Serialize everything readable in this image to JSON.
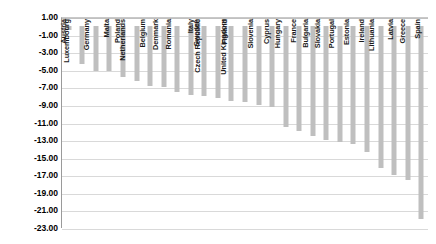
{
  "chart_data": {
    "type": "bar",
    "title": "",
    "subtitle": "",
    "xlabel": "",
    "ylabel": "",
    "ylim": [
      -23,
      1
    ],
    "grid": true,
    "legend": "none",
    "orientation": "vertical",
    "bar_color": "#bfbfbf",
    "ytick_labels": [
      "1.00",
      "-1.00",
      "-3.00",
      "-5.00",
      "-7.00",
      "-9.00",
      "-11.00",
      "-13.00",
      "-15.00",
      "-17.00",
      "-19.00",
      "-21.00",
      "-23.00"
    ],
    "ytick_values": [
      1,
      -1,
      -3,
      -5,
      -7,
      -9,
      -11,
      -13,
      -15,
      -17,
      -19,
      -21,
      -23
    ],
    "categories": [
      "Austria",
      "Luxembourg",
      "Germany",
      "Malta",
      "Poland",
      "Netherlands",
      "Belgium",
      "Denmark",
      "Romania",
      "Italy",
      "Sweden",
      "Czech Republic",
      "Finland",
      "United Kingdom",
      "Slovenia",
      "Cyprus",
      "Hungary",
      "France",
      "Bulgaria",
      "Slovakia",
      "Portugal",
      "Estonia",
      "Ireland",
      "Lithuania",
      "Latvia",
      "Greece",
      "Spain"
    ],
    "values": [
      -0.5,
      -4.3,
      -5.2,
      -5.1,
      -5.8,
      -6.3,
      -6.8,
      -7.0,
      -7.5,
      -7.9,
      -8.0,
      -8.2,
      -8.5,
      -8.7,
      -9.0,
      -9.2,
      -11.5,
      -12.0,
      -12.5,
      -13.0,
      -13.2,
      -13.5,
      -14.3,
      -16.2,
      -17.0,
      -17.5,
      -22.0
    ]
  }
}
